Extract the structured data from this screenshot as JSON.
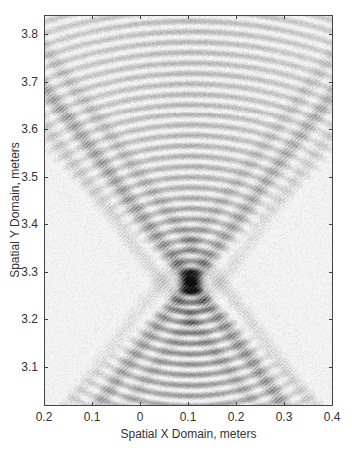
{
  "chart_data": {
    "type": "heatmap",
    "title": "",
    "xlabel": "Spatial X Domain, meters",
    "ylabel": "Spatial Y Domain, meters",
    "colormap": "grayscale (white = low, black = high)",
    "xlim": [
      -0.2,
      0.4
    ],
    "ylim": [
      3.02,
      3.84
    ],
    "x_ticks": [
      -0.2,
      -0.1,
      0,
      0.1,
      0.2,
      0.3,
      0.4
    ],
    "x_tick_labels": [
      "0.2",
      "0.1",
      "0",
      "0.1",
      "0.2",
      "0.3",
      "0.4"
    ],
    "y_ticks": [
      3.1,
      3.2,
      3.3,
      3.4,
      3.5,
      3.6,
      3.7,
      3.8
    ],
    "y_tick_labels": [
      "3.1",
      "3.2",
      "3.3",
      "3.4",
      "3.5",
      "3.6",
      "3.7",
      "3.8"
    ],
    "grid": false,
    "legend": null,
    "features": {
      "focus_point": {
        "x": 0.105,
        "y": 3.28
      },
      "description": "Hourglass-shaped interference pattern: concentric arcs opening upward above and downward below a dark focal point near (0.1, 3.28); diagonal X-shaped bands cross through the focus.",
      "upper_arcs": {
        "count_visible": 18,
        "spacing_m": 0.022
      },
      "lower_arcs": {
        "count_visible": 12,
        "spacing_m": 0.022
      },
      "diagonal_bands": [
        {
          "from": [
            -0.2,
            3.84
          ],
          "to": [
            0.4,
            3.02
          ]
        },
        {
          "from": [
            -0.2,
            3.06
          ],
          "to": [
            0.4,
            3.62
          ]
        }
      ]
    }
  },
  "axes": {
    "xlabel": "Spatial X Domain, meters",
    "ylabel": "Spatial Y Domain, meters"
  }
}
